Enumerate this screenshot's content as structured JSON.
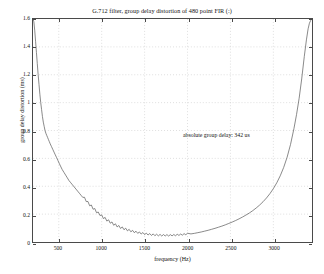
{
  "chart_data": {
    "type": "line",
    "title": "G.712 filter, group delay distortion of 480 point FIR (:)",
    "xlabel": "frequency (Hz)",
    "ylabel": "group delay distortion (ms)",
    "xlim": [
      200,
      3450
    ],
    "ylim": [
      0,
      1.6
    ],
    "grid": true,
    "legend": null,
    "annotations": [
      {
        "text": "absolute group delay: 342 us",
        "x": 1700,
        "y": 0.86
      }
    ],
    "xticks": [
      500,
      1000,
      1500,
      2000,
      2500,
      3000
    ],
    "xtick_labels": [
      "500",
      "1000",
      "1500",
      "2000",
      "2500",
      "3000"
    ],
    "yticks": [
      0,
      0.2,
      0.4,
      0.6,
      0.8,
      1,
      1.2,
      1.4,
      1.6
    ],
    "ytick_labels": [
      "0",
      "0.2",
      "0.4",
      "0.6",
      "0.8",
      "1",
      "1.2",
      "1.4",
      "1.6"
    ],
    "series": [
      {
        "name": "group delay distortion",
        "color": "#555555",
        "x": [
          200,
          210,
          220,
          230,
          240,
          250,
          260,
          270,
          280,
          290,
          300,
          310,
          320,
          330,
          340,
          350,
          360,
          370,
          380,
          390,
          400,
          415,
          430,
          445,
          460,
          475,
          490,
          505,
          520,
          540,
          560,
          580,
          600,
          620,
          640,
          660,
          680,
          700,
          720,
          740,
          760,
          780,
          800,
          820,
          840,
          860,
          880,
          900,
          920,
          940,
          960,
          980,
          1000,
          1020,
          1040,
          1060,
          1080,
          1100,
          1120,
          1140,
          1160,
          1180,
          1200,
          1220,
          1240,
          1260,
          1280,
          1300,
          1320,
          1340,
          1360,
          1380,
          1400,
          1420,
          1440,
          1460,
          1480,
          1500,
          1520,
          1540,
          1560,
          1580,
          1600,
          1620,
          1640,
          1660,
          1680,
          1700,
          1720,
          1740,
          1760,
          1780,
          1800,
          1820,
          1840,
          1860,
          1880,
          1900,
          1920,
          1940,
          1960,
          1980,
          2000,
          2040,
          2080,
          2120,
          2160,
          2200,
          2240,
          2280,
          2320,
          2360,
          2400,
          2440,
          2480,
          2520,
          2560,
          2600,
          2640,
          2680,
          2720,
          2760,
          2800,
          2840,
          2880,
          2920,
          2960,
          3000,
          3040,
          3080,
          3120,
          3160,
          3200,
          3240,
          3270,
          3300,
          3330,
          3360,
          3385,
          3405,
          3420,
          3435,
          3445
        ],
        "y": [
          1.6,
          1.58,
          1.52,
          1.44,
          1.36,
          1.28,
          1.2,
          1.13,
          1.06,
          1.0,
          0.95,
          0.9,
          0.86,
          0.83,
          0.8,
          0.78,
          0.765,
          0.75,
          0.735,
          0.72,
          0.705,
          0.685,
          0.665,
          0.645,
          0.625,
          0.605,
          0.585,
          0.565,
          0.545,
          0.52,
          0.5,
          0.48,
          0.46,
          0.44,
          0.425,
          0.41,
          0.395,
          0.38,
          0.365,
          0.35,
          0.335,
          0.32,
          0.305,
          0.29,
          0.275,
          0.26,
          0.25,
          0.235,
          0.225,
          0.21,
          0.2,
          0.19,
          0.18,
          0.168,
          0.162,
          0.15,
          0.145,
          0.135,
          0.13,
          0.12,
          0.117,
          0.108,
          0.105,
          0.097,
          0.095,
          0.088,
          0.086,
          0.08,
          0.078,
          0.073,
          0.071,
          0.067,
          0.065,
          0.062,
          0.06,
          0.057,
          0.056,
          0.053,
          0.052,
          0.05,
          0.049,
          0.047,
          0.047,
          0.045,
          0.045,
          0.044,
          0.044,
          0.043,
          0.043,
          0.043,
          0.043,
          0.043,
          0.043,
          0.044,
          0.044,
          0.045,
          0.046,
          0.047,
          0.048,
          0.049,
          0.051,
          0.052,
          0.054,
          0.058,
          0.062,
          0.067,
          0.072,
          0.078,
          0.084,
          0.091,
          0.098,
          0.106,
          0.114,
          0.123,
          0.133,
          0.143,
          0.154,
          0.166,
          0.179,
          0.193,
          0.208,
          0.225,
          0.244,
          0.265,
          0.289,
          0.316,
          0.347,
          0.383,
          0.425,
          0.475,
          0.535,
          0.608,
          0.7,
          0.815,
          0.915,
          1.03,
          1.17,
          1.33,
          1.45,
          1.53,
          1.57,
          1.59,
          1.6
        ]
      }
    ],
    "ripple": {
      "start_x": 780,
      "end_x": 2000,
      "amplitude": 0.016,
      "period": 40
    }
  }
}
